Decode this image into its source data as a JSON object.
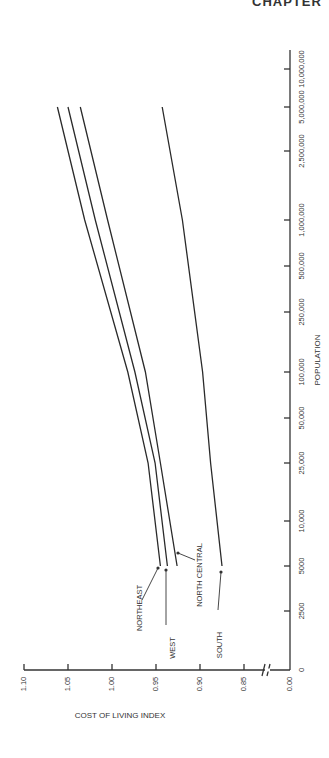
{
  "page": {
    "header_fragment": "CHAPTER"
  },
  "chart_data": {
    "type": "line",
    "orientation": "rotated 90 degrees counter-clockwise (x-axis runs vertically on right, y-axis horizontally at bottom)",
    "title": "",
    "xlabel": "POPULATION",
    "ylabel": "COST OF LIVING INDEX",
    "x_scale": "log",
    "x_tick_labels": [
      "0",
      "2500",
      "5000",
      "10,000",
      "25,000",
      "50,000",
      "100,000",
      "250,000",
      "500,000",
      "1,000,000",
      "2,500,000",
      "5,000,000",
      "10,000,000"
    ],
    "y_tick_labels": [
      "0.00",
      "0.85",
      "0.90",
      "0.95",
      "1.00",
      "1.05",
      "1.10"
    ],
    "y_axis_break": true,
    "ylim": [
      0.85,
      1.1
    ],
    "grid": false,
    "legend": "inline arrow labels",
    "x": [
      5000,
      25000,
      100000,
      1000000,
      5000000
    ],
    "series": [
      {
        "name": "NORTHEAST",
        "values": [
          0.945,
          0.959,
          0.982,
          1.031,
          1.062
        ]
      },
      {
        "name": "WEST",
        "values": [
          0.937,
          0.951,
          0.974,
          1.019,
          1.05
        ]
      },
      {
        "name": "NORTH CENTRAL",
        "values": [
          0.926,
          0.945,
          0.962,
          1.005,
          1.036
        ]
      },
      {
        "name": "SOUTH",
        "values": [
          0.875,
          0.888,
          0.897,
          0.92,
          0.943
        ]
      }
    ],
    "annotations": [
      "NORTHEAST",
      "WEST",
      "NORTH CENTRAL",
      "SOUTH"
    ]
  }
}
